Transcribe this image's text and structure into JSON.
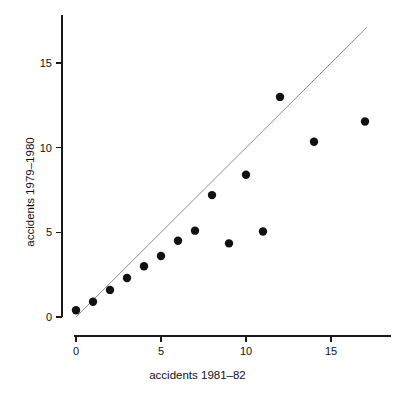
{
  "chart_data": {
    "type": "scatter",
    "title": "",
    "xlabel": "accidents 1981–82",
    "ylabel": "accidents 1979–1980",
    "xlim": [
      -0.6,
      18.2
    ],
    "ylim": [
      -0.6,
      17.7
    ],
    "xticks": [
      0,
      5,
      10,
      15
    ],
    "yticks": [
      0,
      5,
      10,
      15
    ],
    "xtick_labels": [
      "0",
      "5",
      "10",
      "15"
    ],
    "ytick_labels": [
      "0",
      "5",
      "10",
      "15"
    ],
    "grid": false,
    "legend": "none",
    "marker": {
      "shape": "filled-circle",
      "color": "#111111",
      "size": 4.2
    },
    "points": [
      {
        "x": 0,
        "y": 0.4
      },
      {
        "x": 1,
        "y": 0.9
      },
      {
        "x": 2,
        "y": 1.6
      },
      {
        "x": 3,
        "y": 2.3
      },
      {
        "x": 4,
        "y": 3.0
      },
      {
        "x": 5,
        "y": 3.6
      },
      {
        "x": 6,
        "y": 4.5
      },
      {
        "x": 7,
        "y": 5.1
      },
      {
        "x": 8,
        "y": 7.2
      },
      {
        "x": 9,
        "y": 4.35
      },
      {
        "x": 10,
        "y": 8.4
      },
      {
        "x": 11,
        "y": 5.05
      },
      {
        "x": 12,
        "y": 13.0
      },
      {
        "x": 14,
        "y": 10.35
      },
      {
        "x": 17,
        "y": 11.55
      }
    ],
    "annotations": [
      {
        "name": "identity-reference-line",
        "type": "line",
        "description": "y = x reference line",
        "x0": 0,
        "y0": 0,
        "x1": 17.1,
        "y1": 17.1,
        "color": "#8d8d8d"
      }
    ]
  }
}
